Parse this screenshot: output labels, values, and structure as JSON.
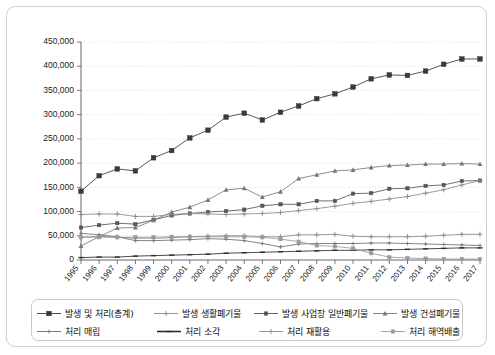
{
  "chart_data": {
    "type": "line",
    "title": "",
    "xlabel": "",
    "ylabel": "",
    "ylim": [
      0,
      450000
    ],
    "ytick_step": 50000,
    "grid": true,
    "legend_position": "bottom",
    "ytick_labels": [
      "0",
      "50,000",
      "100,000",
      "150,000",
      "200,000",
      "250,000",
      "300,000",
      "350,000",
      "400,000",
      "450,000"
    ],
    "categories": [
      "1995",
      "1996",
      "1997",
      "1998",
      "1999",
      "2000",
      "2001",
      "2002",
      "2003",
      "2004",
      "2005",
      "2006",
      "2007",
      "2008",
      "2009",
      "2010",
      "2011",
      "2012",
      "2013",
      "2014",
      "2015",
      "2016",
      "2017"
    ],
    "series": [
      {
        "name": "발생 및 처리(총계)",
        "marker": "square",
        "color": "#3a3a3a",
        "values": [
          142000,
          174000,
          188000,
          184000,
          211000,
          226000,
          252000,
          268000,
          295000,
          303000,
          289000,
          305000,
          318000,
          333000,
          343000,
          357000,
          374000,
          382000,
          381000,
          390000,
          404000,
          415000,
          415000
        ]
      },
      {
        "name": "발생 생활폐기물",
        "marker": "plus",
        "color": "#8a8a8a",
        "values": [
          47000,
          49000,
          47000,
          45000,
          45000,
          46000,
          48000,
          49000,
          50000,
          50000,
          48000,
          48000,
          52000,
          52000,
          53000,
          49000,
          48000,
          48000,
          48000,
          49000,
          51000,
          53000,
          53000
        ]
      },
      {
        "name": "발생 사업장 일반폐기물",
        "marker": "square-small",
        "color": "#555555",
        "values": [
          67000,
          72000,
          76000,
          74000,
          83000,
          92000,
          96000,
          99000,
          101000,
          104000,
          112000,
          115000,
          115000,
          122000,
          122000,
          137000,
          138000,
          147000,
          148000,
          153000,
          155000,
          163000,
          164000
        ]
      },
      {
        "name": "발생 건설폐기물",
        "marker": "triangle",
        "color": "#777777",
        "values": [
          29000,
          48000,
          66000,
          67000,
          82000,
          99000,
          109000,
          124000,
          145000,
          148000,
          130000,
          141000,
          168000,
          176000,
          184000,
          186000,
          191000,
          195000,
          196000,
          198000,
          198000,
          199000,
          198000
        ]
      },
      {
        "name": "처리 매립",
        "marker": "plus-small",
        "color": "#6e6e6e",
        "values": [
          55000,
          52000,
          48000,
          40000,
          40000,
          41000,
          42000,
          44000,
          43000,
          40000,
          34000,
          27000,
          33000,
          34000,
          34000,
          34000,
          35000,
          35000,
          34000,
          33000,
          32000,
          31000,
          30000
        ]
      },
      {
        "name": "처리 소각",
        "marker": "dash",
        "color": "#2b2b2b",
        "values": [
          5000,
          6000,
          6000,
          8000,
          9000,
          10000,
          11000,
          12000,
          14000,
          15000,
          16000,
          17000,
          18000,
          19000,
          20000,
          20000,
          21000,
          21000,
          22000,
          23000,
          24000,
          25000,
          25000
        ]
      },
      {
        "name": "처리 재활용",
        "marker": "plus",
        "color": "#8a8a8a",
        "values": [
          94000,
          95000,
          95000,
          90000,
          90000,
          94000,
          96000,
          95000,
          94000,
          95000,
          96000,
          98000,
          102000,
          106000,
          111000,
          117000,
          121000,
          126000,
          131000,
          138000,
          145000,
          155000,
          164000
        ]
      },
      {
        "name": "처리 해역배출",
        "marker": "square-small",
        "color": "#9a9a9a",
        "values": [
          47000,
          47000,
          47000,
          47000,
          47000,
          48000,
          48000,
          48000,
          48000,
          48000,
          47000,
          43000,
          38000,
          30000,
          28000,
          24000,
          14000,
          6000,
          4000,
          3000,
          2000,
          2000,
          2000
        ]
      }
    ]
  },
  "legend": {
    "row1": [
      {
        "label": "발생 및 처리(총계)"
      },
      {
        "label": "발생 생활폐기물"
      },
      {
        "label": "발생 사업장 일반폐기물"
      },
      {
        "label": "발생 건설폐기물"
      }
    ],
    "row2": [
      {
        "label": "처리 매립"
      },
      {
        "label": "처리 소각"
      },
      {
        "label": "처리 재활용"
      },
      {
        "label": "처리 해역배출"
      }
    ]
  }
}
